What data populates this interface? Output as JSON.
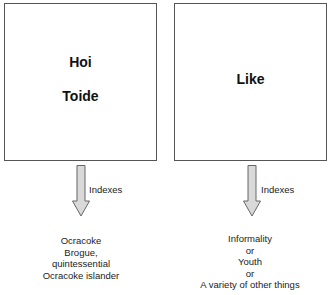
{
  "diagram": {
    "left": {
      "term_lines": [
        "Hoi",
        "Toide"
      ],
      "arrow_label": "Indexes",
      "result_lines": [
        "Ocracoke",
        "Brogue,",
        "quintessential",
        "Ocracoke islander"
      ]
    },
    "right": {
      "term_lines": [
        "Like"
      ],
      "arrow_label": "Indexes",
      "result_lines": [
        "Informality",
        "or",
        "Youth",
        "or",
        "A variety of other things"
      ]
    },
    "colors": {
      "box_border": "#555555",
      "arrow_fill": "#d9d9d9",
      "arrow_stroke": "#666666",
      "text": "#111111"
    }
  }
}
